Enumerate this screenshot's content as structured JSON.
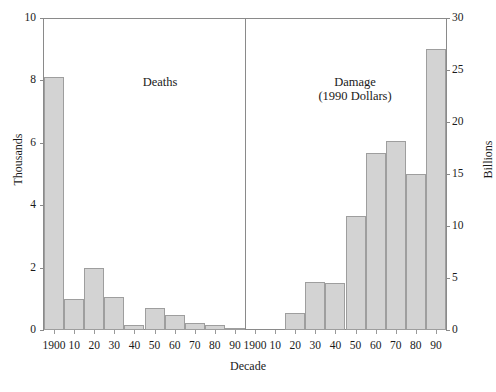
{
  "chart_data": {
    "type": "bar",
    "title": "",
    "xlabel": "Decade",
    "panels": [
      {
        "name": "deaths",
        "title": "Deaths",
        "subtitle": "",
        "axis_side": "left",
        "ylabel": "Thousands",
        "ylim": [
          0,
          10
        ],
        "yticks": [
          0,
          2,
          4,
          6,
          8,
          10
        ],
        "categories": [
          "1900",
          "10",
          "20",
          "30",
          "40",
          "50",
          "60",
          "70",
          "80",
          "90"
        ],
        "values": [
          8.1,
          1.0,
          2.0,
          1.05,
          0.15,
          0.7,
          0.48,
          0.22,
          0.15,
          0.05
        ]
      },
      {
        "name": "damage",
        "title": "Damage",
        "subtitle": "(1990 Dollars)",
        "axis_side": "right",
        "ylabel": "Billions",
        "ylim": [
          0,
          30
        ],
        "yticks": [
          0,
          5,
          10,
          15,
          20,
          25,
          30
        ],
        "categories": [
          "1900",
          "10",
          "20",
          "30",
          "40",
          "50",
          "60",
          "70",
          "80",
          "90"
        ],
        "values": [
          0,
          0,
          1.6,
          4.6,
          4.5,
          11.0,
          17.0,
          18.2,
          15.0,
          27.0
        ]
      }
    ],
    "grid": false,
    "legend": "none",
    "bar_color": "#d3d3d3",
    "bar_edge_color": "#9e9e9e",
    "axis_color": "#8a8a8a"
  },
  "axes": {
    "left_title": "Thousands",
    "right_title": "Billions",
    "x_title": "Decade",
    "left_ticks": [
      "0",
      "2",
      "4",
      "6",
      "8",
      "10"
    ],
    "right_ticks": [
      "0",
      "5",
      "10",
      "15",
      "20",
      "25",
      "30"
    ],
    "x_ticks_left": [
      "1900",
      "10",
      "20",
      "30",
      "40",
      "50",
      "60",
      "70",
      "80",
      "90"
    ],
    "x_ticks_right": [
      "1900",
      "10",
      "20",
      "30",
      "40",
      "50",
      "60",
      "70",
      "80",
      "90"
    ]
  },
  "panel_labels": {
    "deaths": "Deaths",
    "damage_line1": "Damage",
    "damage_line2": "(1990 Dollars)"
  },
  "caption": {
    "remnant": ""
  }
}
